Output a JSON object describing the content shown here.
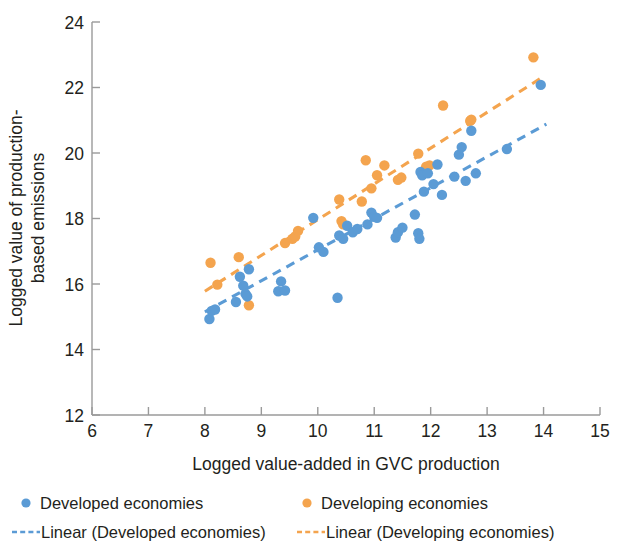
{
  "chart_data": {
    "type": "scatter",
    "title": "",
    "xlabel": "Logged value-added in GVC production",
    "ylabel": "Logged value of production-based emissions",
    "xlim": [
      6,
      15
    ],
    "ylim": [
      12,
      24
    ],
    "xticks": [
      6,
      7,
      8,
      9,
      10,
      11,
      12,
      13,
      14,
      15
    ],
    "yticks": [
      12,
      14,
      16,
      18,
      20,
      22,
      24
    ],
    "grid": false,
    "legend_position": "below-axis",
    "colors": {
      "developed": "#5B9BD5",
      "developing": "#F4A44E",
      "axis": "#9a9a9a",
      "text": "#231f20",
      "background": "#ffffff"
    },
    "series": [
      {
        "name": "Developed economies",
        "type": "scatter",
        "color": "#5B9BD5",
        "points": [
          [
            8.08,
            14.93
          ],
          [
            8.12,
            15.18
          ],
          [
            8.18,
            15.22
          ],
          [
            8.55,
            15.45
          ],
          [
            8.62,
            16.22
          ],
          [
            8.68,
            15.95
          ],
          [
            8.72,
            15.7
          ],
          [
            8.75,
            15.62
          ],
          [
            8.78,
            16.45
          ],
          [
            9.3,
            15.78
          ],
          [
            9.35,
            16.08
          ],
          [
            9.42,
            15.8
          ],
          [
            9.92,
            18.02
          ],
          [
            10.02,
            17.12
          ],
          [
            10.1,
            16.98
          ],
          [
            10.35,
            15.58
          ],
          [
            10.38,
            17.48
          ],
          [
            10.45,
            17.38
          ],
          [
            10.52,
            17.78
          ],
          [
            10.62,
            17.58
          ],
          [
            10.7,
            17.68
          ],
          [
            10.88,
            17.82
          ],
          [
            10.95,
            18.18
          ],
          [
            11.0,
            18.05
          ],
          [
            11.05,
            18.02
          ],
          [
            11.38,
            17.42
          ],
          [
            11.42,
            17.58
          ],
          [
            11.5,
            17.72
          ],
          [
            11.72,
            18.12
          ],
          [
            11.78,
            17.55
          ],
          [
            11.8,
            17.38
          ],
          [
            11.82,
            19.42
          ],
          [
            11.85,
            19.32
          ],
          [
            11.88,
            18.82
          ],
          [
            11.95,
            19.38
          ],
          [
            12.05,
            19.05
          ],
          [
            12.12,
            19.65
          ],
          [
            12.2,
            18.72
          ],
          [
            12.42,
            19.28
          ],
          [
            12.5,
            19.95
          ],
          [
            12.55,
            20.18
          ],
          [
            12.62,
            19.15
          ],
          [
            12.72,
            20.68
          ],
          [
            12.8,
            19.38
          ],
          [
            13.35,
            20.12
          ],
          [
            13.95,
            22.08
          ]
        ]
      },
      {
        "name": "Developing economies",
        "type": "scatter",
        "color": "#F4A44E",
        "points": [
          [
            8.1,
            16.65
          ],
          [
            8.22,
            15.98
          ],
          [
            8.6,
            16.82
          ],
          [
            8.78,
            15.35
          ],
          [
            9.42,
            17.25
          ],
          [
            9.55,
            17.38
          ],
          [
            9.6,
            17.45
          ],
          [
            9.65,
            17.62
          ],
          [
            10.38,
            18.58
          ],
          [
            10.42,
            17.92
          ],
          [
            10.45,
            17.82
          ],
          [
            10.78,
            18.52
          ],
          [
            10.85,
            19.78
          ],
          [
            10.95,
            18.92
          ],
          [
            11.05,
            19.32
          ],
          [
            11.18,
            19.62
          ],
          [
            11.42,
            19.18
          ],
          [
            11.48,
            19.25
          ],
          [
            11.78,
            19.98
          ],
          [
            11.85,
            19.38
          ],
          [
            11.92,
            19.58
          ],
          [
            11.98,
            19.62
          ],
          [
            12.22,
            21.45
          ],
          [
            12.7,
            20.98
          ],
          [
            12.72,
            21.02
          ],
          [
            13.82,
            22.92
          ]
        ]
      }
    ],
    "trendlines": [
      {
        "name": "Linear (Developed economies)",
        "color": "#5B9BD5",
        "style": "dashed",
        "x_start": 8.0,
        "y_start": 15.15,
        "x_end": 14.05,
        "y_end": 20.88
      },
      {
        "name": "Linear (Developing economies)",
        "color": "#F4A44E",
        "style": "dashed",
        "x_start": 8.0,
        "y_start": 15.78,
        "x_end": 13.95,
        "y_end": 22.28
      }
    ]
  },
  "legend": {
    "items": [
      {
        "marker": "dot",
        "label": "Developed economies",
        "color": "#5B9BD5"
      },
      {
        "marker": "dot",
        "label": "Developing economies",
        "color": "#F4A44E"
      },
      {
        "marker": "dashed-line",
        "label": "Linear (Developed economies)",
        "color": "#5B9BD5"
      },
      {
        "marker": "dashed-line",
        "label": "Linear (Developing economies)",
        "color": "#F4A44E"
      }
    ]
  },
  "axes": {
    "x_title": "Logged value-added in GVC production",
    "y_title_line1": "Logged value of production-",
    "y_title_line2": "based emissions"
  }
}
